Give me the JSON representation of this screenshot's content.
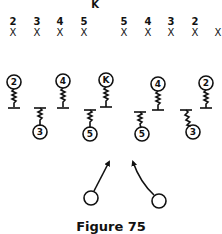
{
  "figure": {
    "caption": "Figure 75",
    "kicker_label": "K",
    "kickoff_line": {
      "left": [
        {
          "number": "2",
          "mark": "X"
        },
        {
          "number": "3",
          "mark": "X"
        },
        {
          "number": "4",
          "mark": "X"
        },
        {
          "number": "5",
          "mark": "X"
        }
      ],
      "right": [
        {
          "number": "5",
          "mark": "X"
        },
        {
          "number": "4",
          "mark": "X"
        },
        {
          "number": "3",
          "mark": "X"
        },
        {
          "number": "2",
          "mark": "X"
        },
        {
          "number": "",
          "mark": "X"
        }
      ]
    },
    "front_blockers": [
      {
        "label": "2"
      },
      {
        "label": "4"
      },
      {
        "label": "K"
      },
      {
        "label": "4"
      },
      {
        "label": "2"
      }
    ],
    "second_blockers": [
      {
        "label": "3"
      },
      {
        "label": "5"
      },
      {
        "label": "5"
      },
      {
        "label": "3"
      }
    ],
    "returners": [
      {
        "label": "",
        "direction": "up-right"
      },
      {
        "label": "",
        "direction": "up-left"
      }
    ]
  }
}
